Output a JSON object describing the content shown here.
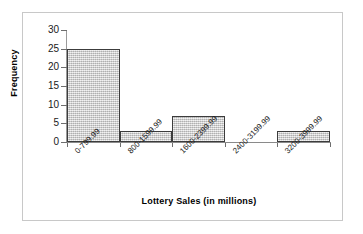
{
  "chart_data": {
    "type": "bar",
    "title": "",
    "subtitle": "",
    "xlabel": "Lottery Sales (in millions)",
    "ylabel": "Frequency",
    "categories": [
      "0-799.99",
      "800-1599.99",
      "1600-2399.99",
      "2400-3199.99",
      "3200-3999.99"
    ],
    "values": [
      25,
      3,
      7,
      0,
      3
    ],
    "ylim": [
      0,
      30
    ],
    "yticks": [
      0,
      5,
      10,
      15,
      20,
      25,
      30
    ],
    "ytick_labels": [
      "0",
      "5",
      "10",
      "15",
      "20",
      "25",
      "30"
    ],
    "grid": false,
    "legend": false,
    "legend_position": "none",
    "bar_style": "histogram-adjacent",
    "colors": {
      "bar_fill": "#cdcdcd",
      "bar_border": "#3c3c3c",
      "axis": "#8a8a8a",
      "text": "#1a1a1a",
      "background": "#ffffff",
      "frame": "#c8c8c8"
    }
  }
}
